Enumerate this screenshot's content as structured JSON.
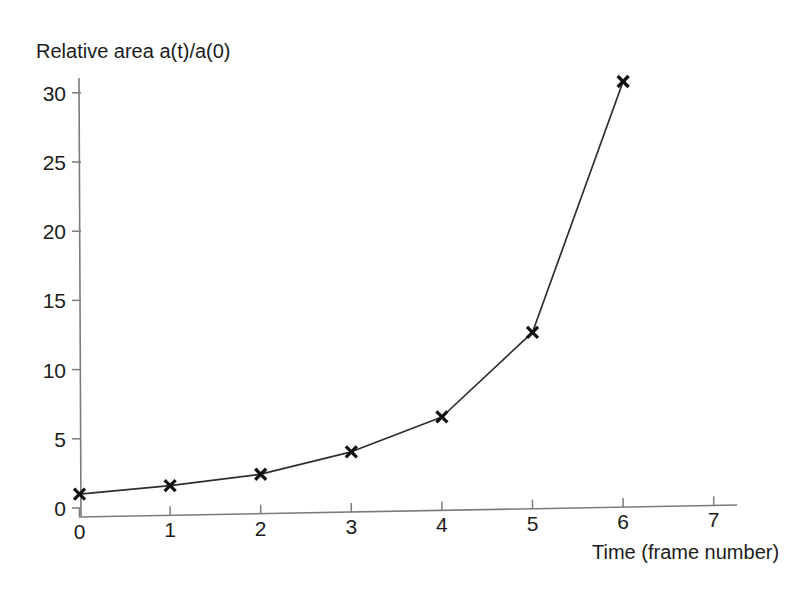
{
  "chart_data": {
    "type": "line",
    "title": "",
    "xlabel": "Time (frame number)",
    "ylabel": "Relative area a(t)/a(0)",
    "x": [
      0,
      1,
      2,
      3,
      4,
      5,
      6
    ],
    "values": [
      1.0,
      1.5,
      2.2,
      3.7,
      6.1,
      12.1,
      30.1
    ],
    "series": [
      {
        "name": "Relative area a(t)/a(0)",
        "x": [
          0,
          1,
          2,
          3,
          4,
          5,
          6
        ],
        "values": [
          1.0,
          1.5,
          2.2,
          3.7,
          6.1,
          12.1,
          30.1
        ]
      }
    ],
    "xlim": [
      0,
      7.3
    ],
    "ylim": [
      0,
      31.5
    ],
    "xticks": [
      0,
      1,
      2,
      3,
      4,
      5,
      6,
      7
    ],
    "yticks": [
      0,
      5,
      10,
      15,
      20,
      25,
      30
    ],
    "xtick_labels": [
      "0",
      "1",
      "2",
      "3",
      "4",
      "5",
      "6",
      "7"
    ],
    "ytick_labels": [
      "0",
      "5",
      "10",
      "15",
      "20",
      "25",
      "30"
    ],
    "grid": false,
    "legend": null,
    "legend_position": "none",
    "marker": "x",
    "marker_color": "#111111",
    "line_color": "#2e2e2e",
    "axis_color": "#7b7b7b",
    "background": "#ffffff",
    "annotations": []
  },
  "labels": {
    "y_axis_title": "Relative area a(t)/a(0)",
    "x_axis_title": "Time (frame number)"
  }
}
